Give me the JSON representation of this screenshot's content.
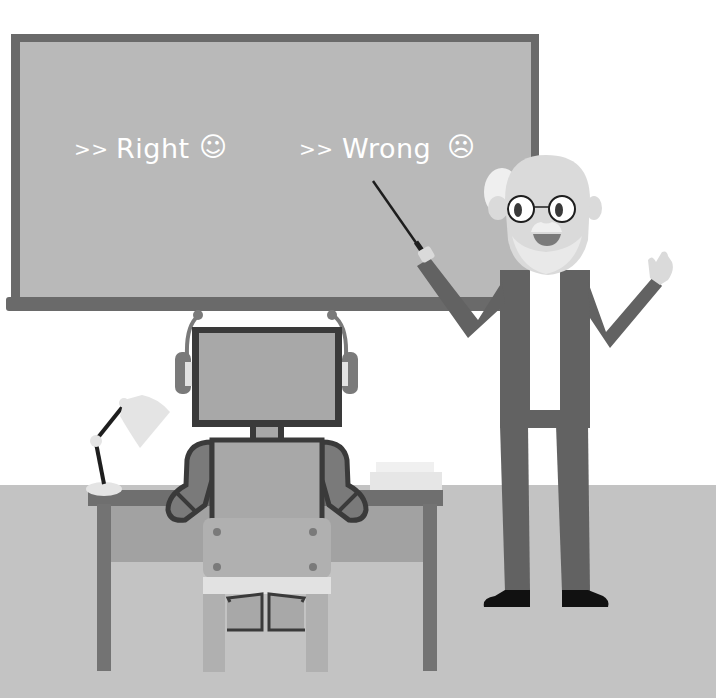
{
  "scene": {
    "title": "Teacher instructing robot at desk",
    "palette": {
      "background": "#ffffff",
      "floor": "#c3c3c3",
      "board_frame": "#6a6a6a",
      "board_surface": "#b9b9b9",
      "board_text": "#ffffff",
      "robot_outline": "#3a3a3a",
      "robot_body": "#a8a8a8",
      "robot_limb": "#7a7a7a",
      "desk_top": "#6f6f6f",
      "desk_panel": "#a2a2a2",
      "desk_leg": "#737373",
      "chair": "#b0b0b0",
      "chair_band": "#e2e2e2",
      "lamp_shade": "#e4e4e4",
      "lamp_arm": "#1e1e1e",
      "suit": "#626262",
      "shirt": "#ffffff",
      "skin": "#dadada",
      "hair": "#efefef",
      "shoes": "#111111",
      "papers": "#e6e6e6"
    }
  },
  "board": {
    "labels": [
      {
        "prefix": ">>",
        "text": "Right",
        "icon": "smiley-face-icon",
        "glyph": "☺"
      },
      {
        "prefix": ">>",
        "text": "Wrong",
        "icon": "frowning-face-icon",
        "glyph": "☹"
      }
    ]
  }
}
